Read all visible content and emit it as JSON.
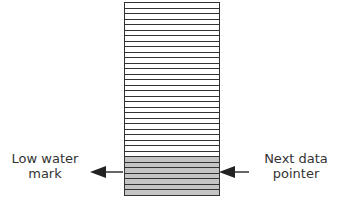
{
  "diagram": {
    "type": "buffer-stack",
    "total_slots": 35,
    "filled_slots": 7,
    "fill_color": "#c4c4c4",
    "empty_color": "#ffffff",
    "line_color": "#333333"
  },
  "labels": {
    "low_water_mark": "Low water mark",
    "low_water_mark_line1": "Low water",
    "low_water_mark_line2": "mark",
    "next_data_pointer": "Next data pointer",
    "next_data_pointer_line1": "Next data",
    "next_data_pointer_line2": "pointer"
  },
  "arrows": {
    "left": {
      "direction": "left",
      "points_to": "low_water_mark"
    },
    "right": {
      "direction": "left",
      "points_to": "next_data_pointer"
    }
  }
}
